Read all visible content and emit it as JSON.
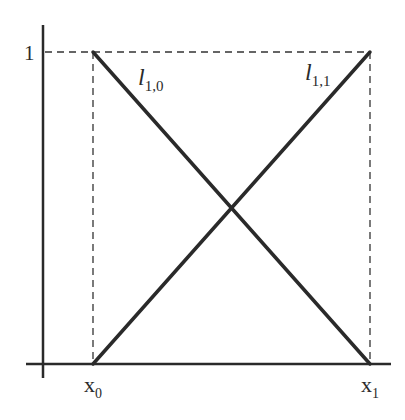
{
  "diagram": {
    "type": "linear basis functions (hat functions) on interval",
    "y_tick_label": "1",
    "x_tick_labels": [
      {
        "base": "x",
        "sub": "0"
      },
      {
        "base": "x",
        "sub": "1"
      }
    ],
    "curves": [
      {
        "name": "l_{1,0}",
        "base": "l",
        "sub": "1,0",
        "from": [
          0,
          1
        ],
        "to": [
          1,
          0
        ],
        "description": "decreasing line from (x0,1) to (x1,0)"
      },
      {
        "name": "l_{1,1}",
        "base": "l",
        "sub": "1,1",
        "from": [
          0,
          0
        ],
        "to": [
          1,
          1
        ],
        "description": "increasing line from (x0,0) to (x1,1)"
      }
    ],
    "guides": [
      "dashed horizontal line at y=1",
      "dashed vertical line at x0",
      "dashed vertical line at x1"
    ],
    "intersection": [
      0.5,
      0.5
    ],
    "colors": {
      "line": "#2a2a2a",
      "axis": "#2a2a2a",
      "dash": "#333333"
    }
  }
}
